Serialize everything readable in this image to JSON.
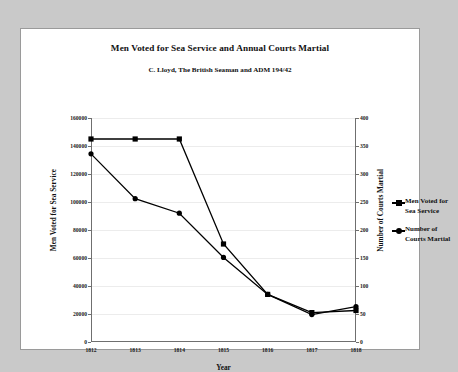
{
  "chart_data": {
    "type": "line",
    "title": "Men Voted for Sea Service and Annual Courts Martial",
    "subtitle": "C. Lloyd, The British Seaman and ADM 194/42",
    "xlabel": "Year",
    "ylabel": "Men Voted for Sea Service",
    "ylabel_right": "Number of Courts Martial",
    "categories": [
      "1812",
      "1813",
      "1814",
      "1815",
      "1816",
      "1817",
      "1818"
    ],
    "x": [
      1812,
      1813,
      1814,
      1815,
      1816,
      1817,
      1818
    ],
    "ylim": [
      0,
      160000
    ],
    "ylim_right": [
      0,
      400
    ],
    "yticks": [
      "0",
      "20000",
      "40000",
      "60000",
      "80000",
      "100000",
      "120000",
      "140000",
      "160000"
    ],
    "ytick_values": [
      0,
      20000,
      40000,
      60000,
      80000,
      100000,
      120000,
      140000,
      160000
    ],
    "yticks_right": [
      "0",
      "50",
      "100",
      "150",
      "200",
      "250",
      "300",
      "350",
      "400"
    ],
    "ytick_values_right": [
      0,
      50,
      100,
      150,
      200,
      250,
      300,
      350,
      400
    ],
    "grid": true,
    "legend_position": "right",
    "series": [
      {
        "name": "Men Voted for\nSea Service",
        "legend_label": "Men Voted for Sea Service",
        "axis": "left",
        "marker": "square",
        "color": "#000000",
        "values": [
          145000,
          145000,
          145000,
          70000,
          34000,
          21000,
          22500
        ]
      },
      {
        "name": "Number of\nCourts Martial",
        "legend_label": "Number of Courts Martial",
        "axis": "right",
        "marker": "circle",
        "color": "#000000",
        "values": [
          336,
          256,
          230,
          151,
          85,
          49,
          63
        ]
      }
    ]
  },
  "colors": {
    "page_background": "#c9c9c9",
    "figure_background": "#ffffff",
    "frame_border": "#9a9a9a",
    "axis": "#6f6f6f",
    "gridline": "#ececec",
    "series": "#000000",
    "text": "#111111"
  }
}
